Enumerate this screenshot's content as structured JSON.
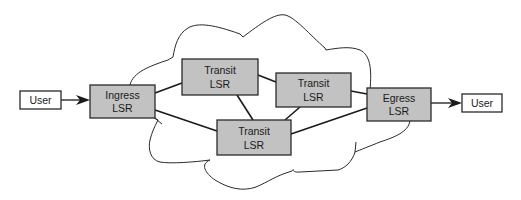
{
  "diagram": {
    "type": "network",
    "cloud": "MPLS network",
    "nodes": [
      {
        "id": "user_in",
        "kind": "user",
        "lines": [
          "User"
        ],
        "x": 20,
        "y": 91,
        "w": 41,
        "h": 18
      },
      {
        "id": "ingress",
        "kind": "lsr",
        "lines": [
          "Ingress",
          "LSR"
        ],
        "x": 90,
        "y": 85,
        "w": 65,
        "h": 33
      },
      {
        "id": "transit1",
        "kind": "lsr",
        "lines": [
          "Transit",
          "LSR"
        ],
        "x": 182,
        "y": 59,
        "w": 76,
        "h": 36
      },
      {
        "id": "transit2",
        "kind": "lsr",
        "lines": [
          "Transit",
          "LSR"
        ],
        "x": 276,
        "y": 73,
        "w": 75,
        "h": 34
      },
      {
        "id": "transit3",
        "kind": "lsr",
        "lines": [
          "Transit",
          "LSR"
        ],
        "x": 217,
        "y": 120,
        "w": 74,
        "h": 35
      },
      {
        "id": "egress",
        "kind": "lsr",
        "lines": [
          "Egress",
          "LSR"
        ],
        "x": 367,
        "y": 88,
        "w": 64,
        "h": 33
      },
      {
        "id": "user_out",
        "kind": "user",
        "lines": [
          "User"
        ],
        "x": 462,
        "y": 94,
        "w": 40,
        "h": 18
      }
    ],
    "edges": [
      {
        "from": "user_in",
        "to": "ingress",
        "directed": true
      },
      {
        "from": "ingress",
        "to": "transit1",
        "directed": false
      },
      {
        "from": "ingress",
        "to": "transit3",
        "directed": false
      },
      {
        "from": "transit1",
        "to": "transit2",
        "directed": false
      },
      {
        "from": "transit1",
        "to": "transit3",
        "directed": false
      },
      {
        "from": "transit2",
        "to": "transit3",
        "directed": false
      },
      {
        "from": "transit2",
        "to": "egress",
        "directed": false
      },
      {
        "from": "transit3",
        "to": "egress",
        "directed": false
      },
      {
        "from": "egress",
        "to": "user_out",
        "directed": true
      }
    ],
    "labels": {
      "user_in": {
        "line1": "User"
      },
      "ingress": {
        "line1": "Ingress",
        "line2": "LSR"
      },
      "transit1": {
        "line1": "Transit",
        "line2": "LSR"
      },
      "transit2": {
        "line1": "Transit",
        "line2": "LSR"
      },
      "transit3": {
        "line1": "Transit",
        "line2": "LSR"
      },
      "egress": {
        "line1": "Egress",
        "line2": "LSR"
      },
      "user_out": {
        "line1": "User"
      }
    },
    "colors": {
      "lsr_fill": "#c2c2c2",
      "user_fill": "#ffffff",
      "stroke": "#1a1a1a"
    }
  }
}
